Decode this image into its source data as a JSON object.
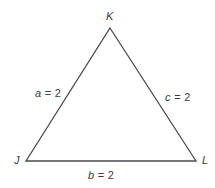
{
  "figure": {
    "kind": "geometry-diagram",
    "shape": "triangle",
    "background_color": "#ffffff",
    "stroke_color": "#4a4a4a",
    "text_color": "#3b3b3b"
  },
  "vertices": [
    {
      "id": "K",
      "label": "K",
      "x": 110,
      "y": 28,
      "name": "vertex-k"
    },
    {
      "id": "J",
      "label": "J",
      "x": 26,
      "y": 161,
      "name": "vertex-j"
    },
    {
      "id": "L",
      "label": "L",
      "x": 196,
      "y": 161,
      "name": "vertex-l"
    }
  ],
  "sides": [
    {
      "id": "a",
      "variable": "a",
      "relation": "=",
      "value": "2",
      "text": "a = 2",
      "between": "J-K",
      "name": "side-a"
    },
    {
      "id": "b",
      "variable": "b",
      "relation": "=",
      "value": "2",
      "text": "b = 2",
      "between": "J-L",
      "name": "side-b"
    },
    {
      "id": "c",
      "variable": "c",
      "relation": "=",
      "value": "2",
      "text": "c = 2",
      "between": "K-L",
      "name": "side-c"
    }
  ],
  "labels": {
    "vertex_k": "K",
    "vertex_j": "J",
    "vertex_l": "L",
    "side_a_var": "a",
    "side_a_eq": " = 2",
    "side_b_var": "b",
    "side_b_eq": " = 2",
    "side_c_var": "c",
    "side_c_eq": " = 2"
  },
  "geometry": {
    "polygon_points": "110,28 196,161 26,161",
    "stroke_width": "1.3"
  }
}
